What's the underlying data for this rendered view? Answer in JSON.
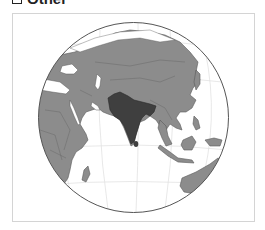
{
  "legend": {
    "items": [
      {
        "label": "Other",
        "swatch_color": "#ffffff"
      }
    ]
  },
  "map": {
    "projection": "orthographic",
    "highlighted_region": "South Asia",
    "colors": {
      "ocean": "#ffffff",
      "land": "#8c8c8c",
      "highlight": "#3f3f3f",
      "borders": "#5a5a5a",
      "graticule": "#e2e2e2",
      "globe_outline": "#555555",
      "frame": "#d4d4d4"
    }
  }
}
